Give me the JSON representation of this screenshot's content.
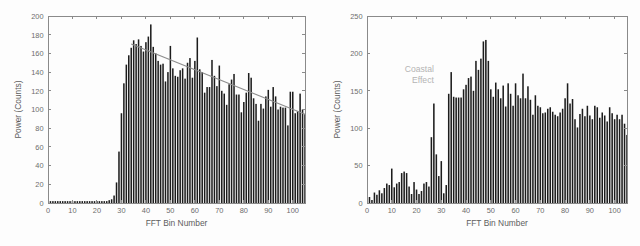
{
  "figure": {
    "background": "#fdfdfd",
    "bar_color": "#1c1c1c",
    "axis_color": "#8a8a8a",
    "label_color": "#6d6d6d",
    "trend_color": "#8d8d8d",
    "annotation_color": "#b4b4b4"
  },
  "chart_data": [
    {
      "type": "bar",
      "id": "left-panel",
      "title": "",
      "xlabel": "FFT Bin Number",
      "ylabel": "Power (Counts)",
      "xlim": [
        0,
        105
      ],
      "ylim": [
        0,
        200
      ],
      "xticks": [
        0,
        10,
        20,
        30,
        40,
        50,
        60,
        70,
        80,
        90,
        100
      ],
      "yticks": [
        0,
        20,
        40,
        60,
        80,
        100,
        120,
        140,
        160,
        180,
        200
      ],
      "xticklabels": [
        "0",
        "10",
        "20",
        "30",
        "40",
        "50",
        "60",
        "70",
        "80",
        "90",
        "100"
      ],
      "yticklabels": [
        "0",
        "20",
        "40",
        "60",
        "80",
        "100",
        "120",
        "140",
        "160",
        "180",
        "200"
      ],
      "grid": false,
      "legend": null,
      "categories": [
        1,
        2,
        3,
        4,
        5,
        6,
        7,
        8,
        9,
        10,
        11,
        12,
        13,
        14,
        15,
        16,
        17,
        18,
        19,
        20,
        21,
        22,
        23,
        24,
        25,
        26,
        27,
        28,
        29,
        30,
        31,
        32,
        33,
        34,
        35,
        36,
        37,
        38,
        39,
        40,
        41,
        42,
        43,
        44,
        45,
        46,
        47,
        48,
        49,
        50,
        51,
        52,
        53,
        54,
        55,
        56,
        57,
        58,
        59,
        60,
        61,
        62,
        63,
        64,
        65,
        66,
        67,
        68,
        69,
        70,
        71,
        72,
        73,
        74,
        75,
        76,
        77,
        78,
        79,
        80,
        81,
        82,
        83,
        84,
        85,
        86,
        87,
        88,
        89,
        90,
        91,
        92,
        93,
        94,
        95,
        96,
        97,
        98,
        99,
        100,
        101,
        102,
        103,
        104,
        105
      ],
      "values": [
        2,
        2,
        2,
        2,
        2,
        2,
        2,
        2,
        2,
        2,
        2,
        2,
        2,
        2,
        2,
        2,
        2,
        2,
        2,
        2,
        2,
        2,
        2,
        2,
        3,
        4,
        8,
        22,
        55,
        96,
        128,
        148,
        158,
        166,
        174,
        170,
        175,
        168,
        162,
        172,
        178,
        191,
        167,
        160,
        152,
        148,
        149,
        130,
        140,
        168,
        144,
        136,
        135,
        142,
        144,
        133,
        150,
        155,
        134,
        152,
        177,
        143,
        140,
        118,
        124,
        124,
        153,
        136,
        125,
        147,
        120,
        117,
        105,
        127,
        132,
        138,
        116,
        116,
        97,
        108,
        118,
        139,
        134,
        112,
        106,
        88,
        106,
        101,
        114,
        121,
        103,
        124,
        114,
        100,
        103,
        102,
        102,
        83,
        119,
        119,
        96,
        98,
        117,
        100,
        95
      ],
      "overlay": {
        "type": "line",
        "name": "linear trend",
        "color": "#8d8d8d",
        "x": [
          34,
          105
        ],
        "y": [
          170,
          95
        ]
      }
    },
    {
      "type": "bar",
      "id": "right-panel",
      "title": "",
      "xlabel": "FFT Bin Number",
      "ylabel": "Power (Counts)",
      "xlim": [
        0,
        105
      ],
      "ylim": [
        0,
        250
      ],
      "xticks": [
        0,
        10,
        20,
        30,
        40,
        50,
        60,
        70,
        80,
        90,
        100
      ],
      "yticks": [
        0,
        50,
        100,
        150,
        200,
        250
      ],
      "xticklabels": [
        "0",
        "10",
        "20",
        "30",
        "40",
        "50",
        "60",
        "70",
        "80",
        "90",
        "100"
      ],
      "yticklabels": [
        "0",
        "50",
        "100",
        "150",
        "200",
        "250"
      ],
      "grid": false,
      "legend": null,
      "annotations": [
        {
          "text_lines": [
            "Coastal",
            "Effect"
          ],
          "x": 27,
          "y": 175,
          "color": "#b4b4b4",
          "align": "right"
        }
      ],
      "categories": [
        1,
        2,
        3,
        4,
        5,
        6,
        7,
        8,
        9,
        10,
        11,
        12,
        13,
        14,
        15,
        16,
        17,
        18,
        19,
        20,
        21,
        22,
        23,
        24,
        25,
        26,
        27,
        28,
        29,
        30,
        31,
        32,
        33,
        34,
        35,
        36,
        37,
        38,
        39,
        40,
        41,
        42,
        43,
        44,
        45,
        46,
        47,
        48,
        49,
        50,
        51,
        52,
        53,
        54,
        55,
        56,
        57,
        58,
        59,
        60,
        61,
        62,
        63,
        64,
        65,
        66,
        67,
        68,
        69,
        70,
        71,
        72,
        73,
        74,
        75,
        76,
        77,
        78,
        79,
        80,
        81,
        82,
        83,
        84,
        85,
        86,
        87,
        88,
        89,
        90,
        91,
        92,
        93,
        94,
        95,
        96,
        97,
        98,
        99,
        100,
        101,
        102,
        103,
        104,
        105
      ],
      "values": [
        8,
        4,
        14,
        11,
        17,
        13,
        20,
        26,
        24,
        46,
        21,
        26,
        28,
        40,
        42,
        40,
        22,
        12,
        28,
        18,
        12,
        16,
        26,
        28,
        22,
        88,
        133,
        65,
        36,
        56,
        13,
        24,
        146,
        175,
        142,
        141,
        141,
        141,
        152,
        158,
        167,
        169,
        150,
        190,
        178,
        193,
        216,
        218,
        190,
        152,
        142,
        161,
        152,
        140,
        157,
        129,
        160,
        146,
        130,
        160,
        144,
        140,
        173,
        140,
        156,
        138,
        118,
        144,
        130,
        128,
        120,
        121,
        126,
        128,
        122,
        118,
        116,
        121,
        126,
        140,
        160,
        133,
        139,
        112,
        101,
        119,
        126,
        116,
        130,
        117,
        112,
        130,
        128,
        114,
        121,
        117,
        109,
        128,
        120,
        112,
        118,
        112,
        118,
        106,
        91
      ]
    }
  ]
}
